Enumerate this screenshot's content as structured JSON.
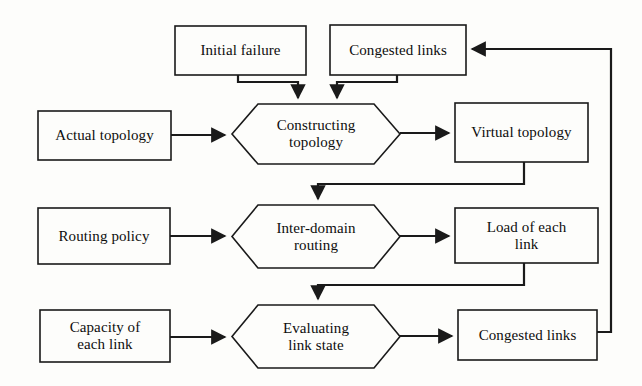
{
  "diagram": {
    "background_color": "#fdfdfb",
    "line_color": "#1a1a1a",
    "text_color": "#0d0d0d",
    "nodes": [
      {
        "id": "initial-failure",
        "label": "Initial failure",
        "shape": "rectangle",
        "x": 175,
        "y": 26,
        "w": 131,
        "h": 49
      },
      {
        "id": "congested-links-top",
        "label": "Congested links",
        "shape": "rectangle",
        "x": 330,
        "y": 25,
        "w": 136,
        "h": 50
      },
      {
        "id": "actual-topology",
        "label": "Actual topology",
        "shape": "rectangle",
        "x": 38,
        "y": 111,
        "w": 133,
        "h": 49
      },
      {
        "id": "constructing-topology",
        "label": "Constructing\ntopology",
        "shape": "hexagon",
        "x": 232,
        "y": 104,
        "w": 168,
        "h": 60
      },
      {
        "id": "virtual-topology",
        "label": "Virtual topology",
        "shape": "rectangle",
        "x": 455,
        "y": 103,
        "w": 133,
        "h": 59
      },
      {
        "id": "routing-policy",
        "label": "Routing policy",
        "shape": "rectangle",
        "x": 38,
        "y": 208,
        "w": 132,
        "h": 56
      },
      {
        "id": "inter-domain-routing",
        "label": "Inter-domain\nrouting",
        "shape": "hexagon",
        "x": 232,
        "y": 205,
        "w": 168,
        "h": 63
      },
      {
        "id": "load-of-each-link",
        "label": "Load of each\nlink",
        "shape": "rectangle",
        "x": 455,
        "y": 208,
        "w": 143,
        "h": 55
      },
      {
        "id": "capacity-of-each-link",
        "label": "Capacity of\neach link",
        "shape": "rectangle",
        "x": 40,
        "y": 310,
        "w": 130,
        "h": 52
      },
      {
        "id": "evaluating-link-state",
        "label": "Evaluating\nlink state",
        "shape": "hexagon",
        "x": 232,
        "y": 305,
        "w": 168,
        "h": 63
      },
      {
        "id": "congested-links-bottom",
        "label": "Congested links",
        "shape": "rectangle",
        "x": 458,
        "y": 310,
        "w": 139,
        "h": 50
      }
    ],
    "edges": [
      {
        "id": "edge-initial-failure-to-constructing",
        "from": "initial-failure",
        "to": "constructing-topology",
        "points": "238,75 238,82 298,82 298,98",
        "arrow": "down"
      },
      {
        "id": "edge-congested-top-to-constructing",
        "from": "congested-links-top",
        "to": "constructing-topology",
        "points": "397,75 397,82 337,82 337,98",
        "arrow": "down"
      },
      {
        "id": "edge-actual-topology-to-constructing",
        "from": "actual-topology",
        "to": "constructing-topology",
        "points": "171,135 225,135",
        "arrow": "right"
      },
      {
        "id": "edge-constructing-to-virtual",
        "from": "constructing-topology",
        "to": "virtual-topology",
        "points": "400,133 449,133",
        "arrow": "right"
      },
      {
        "id": "edge-virtual-to-inter-domain",
        "from": "virtual-topology",
        "to": "inter-domain-routing",
        "points": "524,162 524,184 318,184 318,199",
        "arrow": "down"
      },
      {
        "id": "edge-routing-policy-to-inter-domain",
        "from": "routing-policy",
        "to": "inter-domain-routing",
        "points": "170,236 225,236",
        "arrow": "right"
      },
      {
        "id": "edge-inter-domain-to-load",
        "from": "inter-domain-routing",
        "to": "load-of-each-link",
        "points": "400,236 449,236",
        "arrow": "right"
      },
      {
        "id": "edge-load-to-evaluating",
        "from": "load-of-each-link",
        "to": "evaluating-link-state",
        "points": "524,263 524,285 318,285 318,299",
        "arrow": "down"
      },
      {
        "id": "edge-capacity-to-evaluating",
        "from": "capacity-of-each-link",
        "to": "evaluating-link-state",
        "points": "170,337 225,337",
        "arrow": "right"
      },
      {
        "id": "edge-evaluating-to-congested-bottom",
        "from": "evaluating-link-state",
        "to": "congested-links-bottom",
        "points": "400,336 452,336",
        "arrow": "right"
      },
      {
        "id": "edge-feedback-congested-to-top",
        "from": "congested-links-bottom",
        "to": "congested-links-top",
        "points": "597,332 611,332 611,49 472,49",
        "arrow": "left"
      }
    ]
  }
}
